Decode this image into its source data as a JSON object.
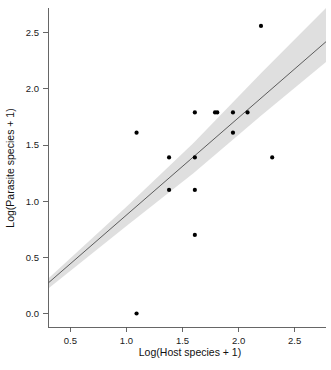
{
  "figure": {
    "width": 331,
    "height": 370,
    "background": "#ffffff"
  },
  "chart_data": {
    "type": "scatter",
    "title": "",
    "xlabel": "Log(Host species + 1)",
    "ylabel": "Log(Parasite species + 1)",
    "xlim": [
      0.3,
      2.78
    ],
    "ylim": [
      -0.12,
      2.72
    ],
    "xticks": [
      0.5,
      1.0,
      1.5,
      2.0,
      2.5
    ],
    "xticklabels": [
      "0.5",
      "1.0",
      "1.5",
      "2.0",
      "2.5"
    ],
    "yticks": [
      0.0,
      0.5,
      1.0,
      1.5,
      2.0,
      2.5
    ],
    "yticklabels": [
      "0.0",
      "0.5",
      "1.0",
      "1.5",
      "2.0",
      "2.5"
    ],
    "grid": false,
    "legend": null,
    "point_color": "#000000",
    "point_size": 4.2,
    "line_color": "#4d4d4d",
    "band_color": "#d9d9d9",
    "x": [
      1.09,
      1.09,
      1.38,
      1.38,
      1.61,
      1.61,
      1.61,
      1.61,
      1.79,
      1.81,
      1.95,
      1.95,
      2.08,
      2.2,
      2.3
    ],
    "y": [
      0.0,
      1.61,
      1.1,
      1.39,
      0.7,
      1.1,
      1.39,
      1.79,
      1.79,
      1.79,
      1.61,
      1.79,
      1.79,
      2.56,
      1.39
    ],
    "series": [
      {
        "name": "observations",
        "points": [
          {
            "x": 1.09,
            "y": 0.0
          },
          {
            "x": 1.09,
            "y": 1.61
          },
          {
            "x": 1.38,
            "y": 1.1
          },
          {
            "x": 1.38,
            "y": 1.39
          },
          {
            "x": 1.61,
            "y": 0.7
          },
          {
            "x": 1.61,
            "y": 1.1
          },
          {
            "x": 1.61,
            "y": 1.39
          },
          {
            "x": 1.61,
            "y": 1.79
          },
          {
            "x": 1.79,
            "y": 1.79
          },
          {
            "x": 1.81,
            "y": 1.79
          },
          {
            "x": 1.95,
            "y": 1.61
          },
          {
            "x": 1.95,
            "y": 1.79
          },
          {
            "x": 2.08,
            "y": 1.79
          },
          {
            "x": 2.2,
            "y": 2.56
          },
          {
            "x": 2.3,
            "y": 1.39
          }
        ]
      }
    ],
    "fit_line": {
      "name": "regression-line",
      "x_start": 0.3,
      "y_start": 0.27,
      "x_end": 2.78,
      "y_end": 2.42
    },
    "confidence_band": {
      "name": "confidence-interval",
      "upper": [
        {
          "x": 0.3,
          "y": 0.31
        },
        {
          "x": 1.0,
          "y": 0.95
        },
        {
          "x": 1.6,
          "y": 1.52
        },
        {
          "x": 2.2,
          "y": 2.14
        },
        {
          "x": 2.78,
          "y": 2.72
        }
      ],
      "lower": [
        {
          "x": 0.3,
          "y": 0.22
        },
        {
          "x": 1.0,
          "y": 0.78
        },
        {
          "x": 1.6,
          "y": 1.25
        },
        {
          "x": 2.2,
          "y": 1.76
        },
        {
          "x": 2.78,
          "y": 2.24
        }
      ]
    }
  }
}
